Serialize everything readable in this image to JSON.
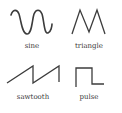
{
  "waveforms": [
    {
      "id": "sine",
      "label": "sine"
    },
    {
      "id": "triangle",
      "label": "triangle"
    },
    {
      "id": "sawtooth",
      "label": "sawtooth"
    },
    {
      "id": "pulse",
      "label": "pulse"
    }
  ],
  "colors": {
    "stroke": "#3c3c3c",
    "text": "#3a3a3a",
    "background": "#ffffff"
  }
}
